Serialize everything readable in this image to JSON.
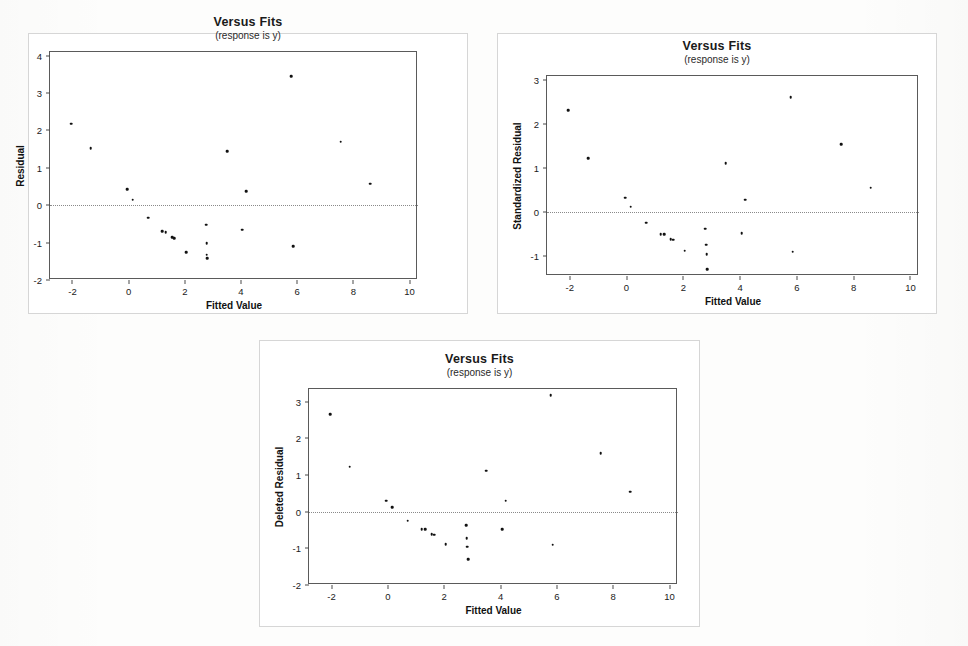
{
  "document": {
    "kind": "scanned-figure-sheet",
    "background_color": "#fdfdfc"
  },
  "charts": [
    {
      "id": "chart-residual",
      "title": "Versus Fits",
      "subtitle": "(response is y)",
      "xlabel": "Fitted Value",
      "ylabel": "Residual",
      "panel": {
        "left": 28,
        "top": 33,
        "width": 440,
        "height": 281
      },
      "plot": {
        "left": 48,
        "top": 50,
        "width": 368,
        "height": 228
      },
      "chart_data": {
        "type": "scatter",
        "title": "Versus Fits",
        "subtitle": "(response is y)",
        "xlabel": "Fitted Value",
        "ylabel": "Residual",
        "xlim": [
          -2.8,
          10.3
        ],
        "ylim": [
          -2.0,
          4.1
        ],
        "xticks": [
          -2,
          0,
          2,
          4,
          6,
          8,
          10
        ],
        "yticks": [
          -2,
          -1,
          0,
          1,
          2,
          3,
          4
        ],
        "grid": false,
        "zero_reference_line": 0,
        "legend": null,
        "points": [
          {
            "x": -2.05,
            "y": 2.18
          },
          {
            "x": -1.35,
            "y": 1.53
          },
          {
            "x": -0.05,
            "y": 0.43
          },
          {
            "x": 0.15,
            "y": 0.15
          },
          {
            "x": 0.7,
            "y": -0.33
          },
          {
            "x": 1.2,
            "y": -0.7
          },
          {
            "x": 1.32,
            "y": -0.72
          },
          {
            "x": 1.55,
            "y": -0.85
          },
          {
            "x": 1.62,
            "y": -0.88
          },
          {
            "x": 2.05,
            "y": -1.25
          },
          {
            "x": 2.75,
            "y": -0.52
          },
          {
            "x": 2.78,
            "y": -1.02
          },
          {
            "x": 2.78,
            "y": -1.32
          },
          {
            "x": 2.8,
            "y": -1.42
          },
          {
            "x": 3.5,
            "y": 1.45
          },
          {
            "x": 4.05,
            "y": -0.65
          },
          {
            "x": 4.18,
            "y": 0.38
          },
          {
            "x": 5.78,
            "y": 3.45
          },
          {
            "x": 5.85,
            "y": -1.1
          },
          {
            "x": 7.55,
            "y": 1.7
          },
          {
            "x": 8.6,
            "y": 0.58
          }
        ]
      }
    },
    {
      "id": "chart-standardized-residual",
      "title": "Versus Fits",
      "subtitle": "(response is y)",
      "xlabel": "Fitted Value",
      "ylabel": "Standardized Residual",
      "panel": {
        "left": 497,
        "top": 33,
        "width": 440,
        "height": 281
      },
      "plot": {
        "left": 545,
        "top": 74,
        "width": 372,
        "height": 200
      },
      "chart_data": {
        "type": "scatter",
        "title": "Versus Fits",
        "subtitle": "(response is y)",
        "xlabel": "Fitted Value",
        "ylabel": "Standardized Residual",
        "xlim": [
          -2.8,
          10.3
        ],
        "ylim": [
          -1.45,
          3.08
        ],
        "xticks": [
          -2,
          0,
          2,
          4,
          6,
          8,
          10
        ],
        "yticks": [
          -1,
          0,
          1,
          2,
          3
        ],
        "grid": false,
        "zero_reference_line": 0,
        "legend": null,
        "points": [
          {
            "x": -2.05,
            "y": 2.3
          },
          {
            "x": -1.35,
            "y": 1.22
          },
          {
            "x": -0.05,
            "y": 0.32
          },
          {
            "x": 0.15,
            "y": 0.12
          },
          {
            "x": 0.7,
            "y": -0.24
          },
          {
            "x": 1.2,
            "y": -0.5
          },
          {
            "x": 1.32,
            "y": -0.5
          },
          {
            "x": 1.55,
            "y": -0.62
          },
          {
            "x": 1.65,
            "y": -0.63
          },
          {
            "x": 2.05,
            "y": -0.88
          },
          {
            "x": 2.78,
            "y": -0.38
          },
          {
            "x": 2.8,
            "y": -0.74
          },
          {
            "x": 2.82,
            "y": -0.95
          },
          {
            "x": 2.85,
            "y": -1.3
          },
          {
            "x": 3.5,
            "y": 1.1
          },
          {
            "x": 4.05,
            "y": -0.48
          },
          {
            "x": 4.18,
            "y": 0.28
          },
          {
            "x": 5.78,
            "y": 2.6
          },
          {
            "x": 5.85,
            "y": -0.9
          },
          {
            "x": 7.55,
            "y": 1.53
          },
          {
            "x": 8.6,
            "y": 0.55
          }
        ]
      }
    },
    {
      "id": "chart-deleted-residual",
      "title": "Versus Fits",
      "subtitle": "(response is y)",
      "xlabel": "Fitted Value",
      "ylabel": "Deleted Residual",
      "panel": {
        "left": 259,
        "top": 340,
        "width": 441,
        "height": 287
      },
      "plot": {
        "left": 307,
        "top": 387,
        "width": 369,
        "height": 196
      },
      "chart_data": {
        "type": "scatter",
        "title": "Versus Fits",
        "subtitle": "(response is y)",
        "xlabel": "Fitted Value",
        "ylabel": "Deleted Residual",
        "xlim": [
          -2.8,
          10.3
        ],
        "ylim": [
          -2.0,
          3.35
        ],
        "xticks": [
          -2,
          0,
          2,
          4,
          6,
          8,
          10
        ],
        "yticks": [
          -2,
          -1,
          0,
          1,
          2,
          3
        ],
        "grid": false,
        "zero_reference_line": 0,
        "legend": null,
        "points": [
          {
            "x": -2.05,
            "y": 2.67
          },
          {
            "x": -1.35,
            "y": 1.23
          },
          {
            "x": -0.05,
            "y": 0.3
          },
          {
            "x": 0.15,
            "y": 0.12
          },
          {
            "x": 0.7,
            "y": -0.25
          },
          {
            "x": 1.2,
            "y": -0.48
          },
          {
            "x": 1.32,
            "y": -0.47
          },
          {
            "x": 1.55,
            "y": -0.62
          },
          {
            "x": 1.65,
            "y": -0.63
          },
          {
            "x": 2.05,
            "y": -0.88
          },
          {
            "x": 2.78,
            "y": -0.37
          },
          {
            "x": 2.8,
            "y": -0.72
          },
          {
            "x": 2.82,
            "y": -0.95
          },
          {
            "x": 2.85,
            "y": -1.3
          },
          {
            "x": 3.5,
            "y": 1.12
          },
          {
            "x": 4.05,
            "y": -0.48
          },
          {
            "x": 4.18,
            "y": 0.3
          },
          {
            "x": 5.78,
            "y": 3.18
          },
          {
            "x": 5.85,
            "y": -0.9
          },
          {
            "x": 7.55,
            "y": 1.6
          },
          {
            "x": 8.6,
            "y": 0.55
          }
        ]
      }
    }
  ]
}
